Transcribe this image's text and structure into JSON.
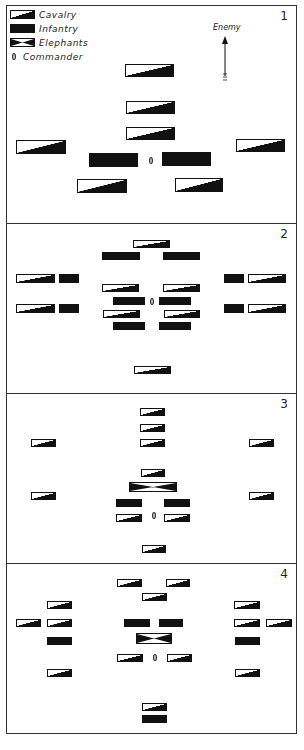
{
  "legend": {
    "items": [
      {
        "key": "cavalry",
        "label": "Cavalry"
      },
      {
        "key": "infantry",
        "label": "Infantry"
      },
      {
        "key": "elephants",
        "label": "Elephants"
      },
      {
        "key": "commander",
        "label": "Commander"
      }
    ]
  },
  "enemy_label": "Enemy",
  "colors": {
    "ink": "#111111",
    "paper": "#ffffff",
    "border": "#333333"
  },
  "panels": [
    {
      "number": "1",
      "top": 5,
      "height": 219,
      "units": [
        {
          "type": "cav",
          "x": 125,
          "y": 64,
          "w": 49,
          "h": 13
        },
        {
          "type": "cav",
          "x": 126,
          "y": 101,
          "w": 49,
          "h": 13
        },
        {
          "type": "cav",
          "x": 126,
          "y": 127,
          "w": 49,
          "h": 13
        },
        {
          "type": "cav",
          "x": 16,
          "y": 140,
          "w": 50,
          "h": 14
        },
        {
          "type": "cav",
          "x": 236,
          "y": 139,
          "w": 49,
          "h": 13
        },
        {
          "type": "inf",
          "x": 89,
          "y": 153,
          "w": 49,
          "h": 14
        },
        {
          "type": "inf",
          "x": 162,
          "y": 152,
          "w": 49,
          "h": 14
        },
        {
          "type": "cav",
          "x": 77,
          "y": 179,
          "w": 50,
          "h": 14
        },
        {
          "type": "cav",
          "x": 175,
          "y": 178,
          "w": 48,
          "h": 14
        }
      ],
      "commander": {
        "x": 149,
        "y": 157
      }
    },
    {
      "number": "2",
      "top": 223,
      "height": 171,
      "units": [
        {
          "type": "cav",
          "x": 133,
          "y": 240,
          "w": 37,
          "h": 8
        },
        {
          "type": "inf",
          "x": 102,
          "y": 252,
          "w": 38,
          "h": 8
        },
        {
          "type": "inf",
          "x": 163,
          "y": 252,
          "w": 37,
          "h": 8
        },
        {
          "type": "cav",
          "x": 16,
          "y": 274,
          "w": 39,
          "h": 9
        },
        {
          "type": "inf",
          "x": 59,
          "y": 274,
          "w": 20,
          "h": 9
        },
        {
          "type": "inf",
          "x": 224,
          "y": 274,
          "w": 20,
          "h": 9
        },
        {
          "type": "cav",
          "x": 248,
          "y": 274,
          "w": 38,
          "h": 9
        },
        {
          "type": "cav",
          "x": 102,
          "y": 284,
          "w": 37,
          "h": 8
        },
        {
          "type": "cav",
          "x": 163,
          "y": 284,
          "w": 37,
          "h": 8
        },
        {
          "type": "inf",
          "x": 113,
          "y": 297,
          "w": 32,
          "h": 8
        },
        {
          "type": "inf",
          "x": 159,
          "y": 297,
          "w": 32,
          "h": 8
        },
        {
          "type": "cav",
          "x": 16,
          "y": 304,
          "w": 39,
          "h": 9
        },
        {
          "type": "inf",
          "x": 59,
          "y": 304,
          "w": 20,
          "h": 9
        },
        {
          "type": "inf",
          "x": 224,
          "y": 304,
          "w": 20,
          "h": 9
        },
        {
          "type": "cav",
          "x": 248,
          "y": 304,
          "w": 38,
          "h": 9
        },
        {
          "type": "cav",
          "x": 103,
          "y": 310,
          "w": 37,
          "h": 8
        },
        {
          "type": "cav",
          "x": 164,
          "y": 310,
          "w": 36,
          "h": 8
        },
        {
          "type": "inf",
          "x": 113,
          "y": 322,
          "w": 32,
          "h": 8
        },
        {
          "type": "inf",
          "x": 159,
          "y": 322,
          "w": 32,
          "h": 8
        },
        {
          "type": "cav",
          "x": 134,
          "y": 366,
          "w": 37,
          "h": 8
        }
      ],
      "commander": {
        "x": 150,
        "y": 298
      }
    },
    {
      "number": "3",
      "top": 393,
      "height": 171,
      "units": [
        {
          "type": "cav",
          "x": 140,
          "y": 408,
          "w": 25,
          "h": 8
        },
        {
          "type": "cav",
          "x": 140,
          "y": 424,
          "w": 25,
          "h": 8
        },
        {
          "type": "cav",
          "x": 140,
          "y": 439,
          "w": 25,
          "h": 8
        },
        {
          "type": "cav",
          "x": 31,
          "y": 439,
          "w": 25,
          "h": 8
        },
        {
          "type": "cav",
          "x": 249,
          "y": 439,
          "w": 25,
          "h": 8
        },
        {
          "type": "cav",
          "x": 141,
          "y": 469,
          "w": 24,
          "h": 8
        },
        {
          "type": "ele",
          "x": 129,
          "y": 482,
          "w": 48,
          "h": 10
        },
        {
          "type": "cav",
          "x": 31,
          "y": 492,
          "w": 25,
          "h": 8
        },
        {
          "type": "cav",
          "x": 249,
          "y": 492,
          "w": 25,
          "h": 8
        },
        {
          "type": "inf",
          "x": 116,
          "y": 499,
          "w": 26,
          "h": 8
        },
        {
          "type": "inf",
          "x": 164,
          "y": 499,
          "w": 26,
          "h": 8
        },
        {
          "type": "cav",
          "x": 116,
          "y": 514,
          "w": 26,
          "h": 8
        },
        {
          "type": "cav",
          "x": 164,
          "y": 514,
          "w": 26,
          "h": 8
        },
        {
          "type": "cav",
          "x": 142,
          "y": 545,
          "w": 24,
          "h": 8
        }
      ],
      "commander": {
        "x": 152,
        "y": 512
      }
    },
    {
      "number": "4",
      "top": 563,
      "height": 171,
      "units": [
        {
          "type": "cav",
          "x": 117,
          "y": 579,
          "w": 25,
          "h": 8
        },
        {
          "type": "cav",
          "x": 166,
          "y": 579,
          "w": 24,
          "h": 8
        },
        {
          "type": "cav",
          "x": 142,
          "y": 593,
          "w": 25,
          "h": 8
        },
        {
          "type": "cav",
          "x": 47,
          "y": 601,
          "w": 25,
          "h": 8
        },
        {
          "type": "cav",
          "x": 234,
          "y": 601,
          "w": 26,
          "h": 8
        },
        {
          "type": "cav",
          "x": 16,
          "y": 619,
          "w": 25,
          "h": 8
        },
        {
          "type": "cav",
          "x": 47,
          "y": 619,
          "w": 25,
          "h": 8
        },
        {
          "type": "inf",
          "x": 124,
          "y": 619,
          "w": 26,
          "h": 8
        },
        {
          "type": "inf",
          "x": 159,
          "y": 619,
          "w": 24,
          "h": 8
        },
        {
          "type": "cav",
          "x": 234,
          "y": 619,
          "w": 26,
          "h": 8
        },
        {
          "type": "cav",
          "x": 266,
          "y": 619,
          "w": 26,
          "h": 8
        },
        {
          "type": "inf",
          "x": 47,
          "y": 637,
          "w": 25,
          "h": 8
        },
        {
          "type": "ele",
          "x": 136,
          "y": 633,
          "w": 36,
          "h": 11
        },
        {
          "type": "inf",
          "x": 235,
          "y": 637,
          "w": 25,
          "h": 8
        },
        {
          "type": "cav",
          "x": 117,
          "y": 654,
          "w": 26,
          "h": 8
        },
        {
          "type": "cav",
          "x": 167,
          "y": 654,
          "w": 25,
          "h": 8
        },
        {
          "type": "cav",
          "x": 47,
          "y": 669,
          "w": 25,
          "h": 8
        },
        {
          "type": "cav",
          "x": 235,
          "y": 669,
          "w": 25,
          "h": 8
        },
        {
          "type": "cav",
          "x": 142,
          "y": 703,
          "w": 25,
          "h": 8
        },
        {
          "type": "inf",
          "x": 142,
          "y": 715,
          "w": 25,
          "h": 8
        }
      ],
      "commander": {
        "x": 153,
        "y": 654
      }
    }
  ]
}
